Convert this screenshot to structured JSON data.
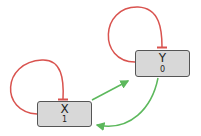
{
  "colors": {
    "inhibition": "#d9534f",
    "activation": "#5cb85c",
    "node_fill": "#d8d8d8",
    "node_border": "#555555"
  },
  "nodes": [
    {
      "id": "X",
      "label": "X",
      "value": "1"
    },
    {
      "id": "Y",
      "label": "Y",
      "value": "0"
    }
  ],
  "edges": [
    {
      "from": "X",
      "to": "X",
      "type": "inhibition"
    },
    {
      "from": "Y",
      "to": "Y",
      "type": "inhibition"
    },
    {
      "from": "X",
      "to": "Y",
      "type": "activation"
    },
    {
      "from": "Y",
      "to": "X",
      "type": "activation"
    }
  ]
}
